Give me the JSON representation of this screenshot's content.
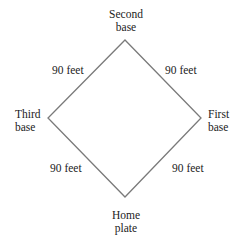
{
  "diagram": {
    "line_color": "#7a7a7a",
    "vertices": {
      "second_base": [
        125,
        40
      ],
      "first_base": [
        201,
        118
      ],
      "home_plate": [
        125,
        197
      ],
      "third_base": [
        48,
        118
      ]
    },
    "bases": {
      "second": "Second\nbase",
      "first": "First\nbase",
      "third": "Third\nbase",
      "home": "Home\nplate"
    },
    "edges": {
      "third_to_second": "90 feet",
      "second_to_first": "90 feet",
      "third_to_home": "90 feet",
      "home_to_first": "90 feet"
    }
  }
}
